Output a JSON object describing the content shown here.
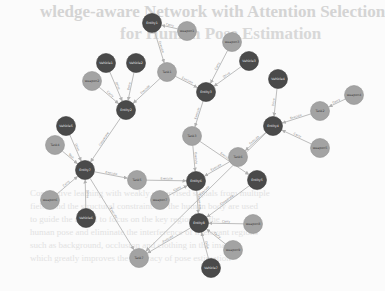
{
  "background": {
    "title_line1": "wledge-aware Network with Attention Selection",
    "title_line2": "for Human Pose Estimation",
    "body_lines": [
      "Contrastive learning with weakly supervised signals from multiple",
      "fields and the structural constraints of the human body are used",
      "to guide the model to focus on the key regions of the",
      "human pose and eliminate the interference of irrelevant regions",
      "such as background, occlusion and clothing in the image",
      "which greatly improves the accuracy of pose estimation"
    ]
  },
  "graph": {
    "colors": {
      "dark": "#4a4a4a",
      "light": "#a3a3a3",
      "edge": "#bdbdbd"
    },
    "nodes": [
      {
        "id": "n1",
        "label": "Entity1",
        "type": "dark",
        "x": 152,
        "y": 23
      },
      {
        "id": "n2",
        "label": "weapon1",
        "type": "light",
        "x": 187,
        "y": 31
      },
      {
        "id": "n3",
        "label": "Vehicle1",
        "type": "dark",
        "x": 106,
        "y": 63
      },
      {
        "id": "n4",
        "label": "Vehicle2",
        "type": "dark",
        "x": 136,
        "y": 63
      },
      {
        "id": "n5",
        "label": "weapon2",
        "type": "light",
        "x": 92,
        "y": 81
      },
      {
        "id": "n6",
        "label": "Task1",
        "type": "light",
        "x": 167,
        "y": 72
      },
      {
        "id": "n7",
        "label": "Entity2",
        "type": "dark",
        "x": 126,
        "y": 110
      },
      {
        "id": "n8",
        "label": "weapon3",
        "type": "light",
        "x": 232,
        "y": 42
      },
      {
        "id": "n9",
        "label": "Vehicle3",
        "type": "dark",
        "x": 249,
        "y": 61
      },
      {
        "id": "n10",
        "label": "Entity3",
        "type": "dark",
        "x": 206,
        "y": 92
      },
      {
        "id": "n11",
        "label": "Vehicle4",
        "type": "dark",
        "x": 278,
        "y": 79
      },
      {
        "id": "n12",
        "label": "Task2",
        "type": "light",
        "x": 320,
        "y": 111
      },
      {
        "id": "n13",
        "label": "weapon4",
        "type": "light",
        "x": 354,
        "y": 95
      },
      {
        "id": "n14",
        "label": "Entity4",
        "type": "dark",
        "x": 273,
        "y": 126
      },
      {
        "id": "n15",
        "label": "weapon5",
        "type": "light",
        "x": 320,
        "y": 148
      },
      {
        "id": "n16",
        "label": "Task3",
        "type": "light",
        "x": 192,
        "y": 136
      },
      {
        "id": "n17",
        "label": "Vehicle5",
        "type": "dark",
        "x": 66,
        "y": 126
      },
      {
        "id": "n18",
        "label": "Task4",
        "type": "light",
        "x": 55,
        "y": 145
      },
      {
        "id": "n19",
        "label": "Entity7",
        "type": "dark",
        "x": 85,
        "y": 170
      },
      {
        "id": "n20",
        "label": "Task5",
        "type": "light",
        "x": 137,
        "y": 180
      },
      {
        "id": "n21",
        "label": "Task6",
        "type": "light",
        "x": 238,
        "y": 157
      },
      {
        "id": "n22",
        "label": "Entity5",
        "type": "dark",
        "x": 257,
        "y": 180
      },
      {
        "id": "n23",
        "label": "Entity6",
        "type": "dark",
        "x": 196,
        "y": 181
      },
      {
        "id": "n24",
        "label": "weapon6",
        "type": "light",
        "x": 50,
        "y": 200
      },
      {
        "id": "n25",
        "label": "weapon7",
        "type": "light",
        "x": 160,
        "y": 200
      },
      {
        "id": "n26",
        "label": "Vehicle6",
        "type": "dark",
        "x": 86,
        "y": 218
      },
      {
        "id": "n27",
        "label": "Task7",
        "type": "light",
        "x": 139,
        "y": 258
      },
      {
        "id": "n28",
        "label": "Entity8",
        "type": "dark",
        "x": 199,
        "y": 223
      },
      {
        "id": "n29",
        "label": "weapon8",
        "type": "light",
        "x": 253,
        "y": 224
      },
      {
        "id": "n30",
        "label": "weapon9",
        "type": "light",
        "x": 233,
        "y": 250
      },
      {
        "id": "n31",
        "label": "Vehicle7",
        "type": "dark",
        "x": 211,
        "y": 268
      }
    ],
    "edges": [
      {
        "from": "n2",
        "to": "n1",
        "label": "Carry"
      },
      {
        "from": "n1",
        "to": "n6",
        "label": "Execute"
      },
      {
        "from": "n3",
        "to": "n7",
        "label": "Drive"
      },
      {
        "from": "n4",
        "to": "n7",
        "label": "Drive"
      },
      {
        "from": "n5",
        "to": "n7",
        "label": "Carry"
      },
      {
        "from": "n6",
        "to": "n7",
        "label": "Execute"
      },
      {
        "from": "n6",
        "to": "n10",
        "label": "Execute"
      },
      {
        "from": "n8",
        "to": "n10",
        "label": "Carry"
      },
      {
        "from": "n9",
        "to": "n10",
        "label": "Drive"
      },
      {
        "from": "n10",
        "to": "n16",
        "label": "Execute"
      },
      {
        "from": "n11",
        "to": "n14",
        "label": "Drive"
      },
      {
        "from": "n12",
        "to": "n14",
        "label": "Execute"
      },
      {
        "from": "n13",
        "to": "n12",
        "label": "Carry"
      },
      {
        "from": "n15",
        "to": "n14",
        "label": "Carry"
      },
      {
        "from": "n14",
        "to": "n21",
        "label": "Execute"
      },
      {
        "from": "n17",
        "to": "n19",
        "label": "Drive"
      },
      {
        "from": "n18",
        "to": "n19",
        "label": "Task"
      },
      {
        "from": "n7",
        "to": "n19",
        "label": "Cooperate"
      },
      {
        "from": "n19",
        "to": "n20",
        "label": "Execute"
      },
      {
        "from": "n20",
        "to": "n23",
        "label": "Execute"
      },
      {
        "from": "n16",
        "to": "n23",
        "label": "Execute"
      },
      {
        "from": "n16",
        "to": "n22",
        "label": "Execute"
      },
      {
        "from": "n21",
        "to": "n23",
        "label": "Execute"
      },
      {
        "from": "n25",
        "to": "n23",
        "label": "Carry"
      },
      {
        "from": "n24",
        "to": "n19",
        "label": "Carry"
      },
      {
        "from": "n26",
        "to": "n19",
        "label": "Drive"
      },
      {
        "from": "n19",
        "to": "n27",
        "label": "Execute"
      },
      {
        "from": "n22",
        "to": "n28",
        "label": "Cooperate"
      },
      {
        "from": "n28",
        "to": "n27",
        "label": "Execute"
      },
      {
        "from": "n14",
        "to": "n27",
        "label": "Execute"
      },
      {
        "from": "n29",
        "to": "n28",
        "label": "Carry"
      },
      {
        "from": "n30",
        "to": "n28",
        "label": "Carry"
      },
      {
        "from": "n31",
        "to": "n28",
        "label": "Drive"
      },
      {
        "from": "n23",
        "to": "n28",
        "label": "Cooperate"
      }
    ]
  }
}
